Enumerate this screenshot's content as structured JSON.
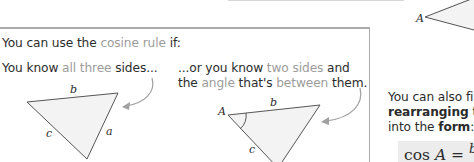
{
  "box": {
    "intro": {
      "prefix": "You can use the ",
      "highlight": "cosine rule",
      "suffix": " if:"
    },
    "case_sides": {
      "prefix": "You know ",
      "highlight": "all three",
      "suffix": " sides..."
    },
    "case_angle": {
      "line1_prefix": "...or you know ",
      "line1_highlight": "two sides",
      "line1_suffix": " and",
      "line2_prefix": "the ",
      "line2_highlight_1": "angle",
      "line2_middle": " that's ",
      "line2_highlight_2": "between",
      "line2_suffix": " them."
    },
    "triangle1_labels": {
      "b": "b",
      "c": "c",
      "a": "a"
    },
    "triangle2_labels": {
      "A": "A",
      "b": "b",
      "c": "c"
    }
  },
  "top_triangle": {
    "vertex_label": "A"
  },
  "side_text": {
    "line1": "You can also fir",
    "line2_bold": "rearranging",
    "line2_rest": " the",
    "line3_prefix": "into the ",
    "line3_bold": "form",
    "line3_suffix": ":"
  },
  "formula": {
    "func": "cos ",
    "var": "A",
    "eq": " = ",
    "numerator_start": "b"
  },
  "colors": {
    "highlight_text": "#9c9c9c",
    "body_text": "#2b2b2b",
    "box_border": "#a9a9a9",
    "triangle_fill": "#f3f3f3",
    "formula_bg": "#ececec",
    "arrow": "#a0a0a0"
  }
}
